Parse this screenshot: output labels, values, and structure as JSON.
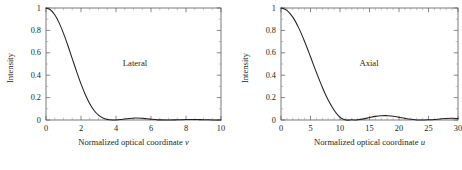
{
  "figure": {
    "background": "#ffffff",
    "axis_color": "#58595b",
    "curve_color": "#231f20",
    "text_color": "#231f20"
  },
  "panels": [
    {
      "id": "lateral",
      "annotation": "Lateral",
      "xlabel_text": "Normalized optical coordinate",
      "xlabel_symbol": "v",
      "ylabel": "Intensity",
      "xticks": [
        "0",
        "2",
        "4",
        "6",
        "8",
        "10"
      ],
      "yticks": [
        "0",
        "0.2",
        "0.4",
        "0.6",
        "0.8",
        "1"
      ]
    },
    {
      "id": "axial",
      "annotation": "Axial",
      "xlabel_text": "Normalized optical coordinate",
      "xlabel_symbol": "u",
      "ylabel": "Intensity",
      "xticks": [
        "0",
        "5",
        "10",
        "15",
        "20",
        "25",
        "30"
      ],
      "yticks": [
        "0",
        "0.2",
        "0.4",
        "0.6",
        "0.8",
        "1"
      ]
    }
  ],
  "chart_data": [
    {
      "type": "line",
      "id": "lateral",
      "title": "Lateral",
      "xlabel": "Normalized optical coordinate v",
      "ylabel": "Intensity",
      "xlim": [
        0,
        10
      ],
      "ylim": [
        0,
        1
      ],
      "xticks": [
        0,
        2,
        4,
        6,
        8,
        10
      ],
      "yticks": [
        0,
        0.2,
        0.4,
        0.6,
        0.8,
        1
      ],
      "grid": false,
      "legend": "none",
      "annotations": [
        {
          "text": "Lateral",
          "x": 5.1,
          "y": 0.55
        }
      ],
      "series": [
        {
          "name": "Airy intensity [2J1(v)/v]^2",
          "x": [
            0,
            0.25,
            0.5,
            0.75,
            1,
            1.25,
            1.5,
            1.75,
            2,
            2.25,
            2.5,
            2.75,
            3,
            3.25,
            3.5,
            3.83,
            4,
            4.25,
            4.5,
            4.75,
            5,
            5.14,
            5.5,
            5.75,
            6,
            6.25,
            6.5,
            7.02,
            7.5,
            8,
            8.42,
            8.75,
            9,
            9.5,
            10
          ],
          "y": [
            1,
            0.9845,
            0.9392,
            0.8673,
            0.7737,
            0.6651,
            0.5487,
            0.4321,
            0.3223,
            0.2254,
            0.1455,
            0.0848,
            0.0432,
            0.0182,
            0.0053,
            0,
            0.0006,
            0.0043,
            0.0096,
            0.014,
            0.0165,
            0.0175,
            0.0147,
            0.0113,
            0.0074,
            0.0037,
            0.0012,
            0,
            0.0018,
            0.0042,
            0.0042,
            0.0035,
            0.0027,
            0.0009,
            0.0001
          ]
        }
      ]
    },
    {
      "type": "line",
      "id": "axial",
      "title": "Axial",
      "xlabel": "Normalized optical coordinate u",
      "ylabel": "Intensity",
      "xlim": [
        0,
        30
      ],
      "ylim": [
        0,
        1
      ],
      "xticks": [
        0,
        5,
        10,
        15,
        20,
        25,
        30
      ],
      "yticks": [
        0,
        0.2,
        0.4,
        0.6,
        0.8,
        1
      ],
      "grid": false,
      "legend": "none",
      "annotations": [
        {
          "text": "Axial",
          "x": 16.5,
          "y": 0.55
        }
      ],
      "series": [
        {
          "name": "Axial intensity [sin(u/4)/(u/4)]^2",
          "x": [
            0,
            1,
            2,
            3,
            4,
            5,
            6,
            7,
            8,
            9,
            10,
            11,
            12,
            12.566,
            13,
            14,
            15,
            16,
            17,
            17.8,
            18,
            19,
            20,
            21,
            22,
            23,
            24,
            25,
            25.13,
            26,
            27,
            28,
            29,
            30
          ],
          "y": [
            1,
            0.9794,
            0.9185,
            0.8226,
            0.7011,
            0.5646,
            0.4248,
            0.2929,
            0.178,
            0.0868,
            0.0238,
            0.0,
            0.0017,
            0,
            0.0015,
            0.0099,
            0.0217,
            0.0324,
            0.0382,
            0.0391,
            0.0387,
            0.0335,
            0.0246,
            0.0145,
            0.0059,
            0.0009,
            0.0,
            0.0022,
            0.0023,
            0.005,
            0.0097,
            0.0134,
            0.0147,
            0.0136
          ]
        }
      ]
    }
  ]
}
